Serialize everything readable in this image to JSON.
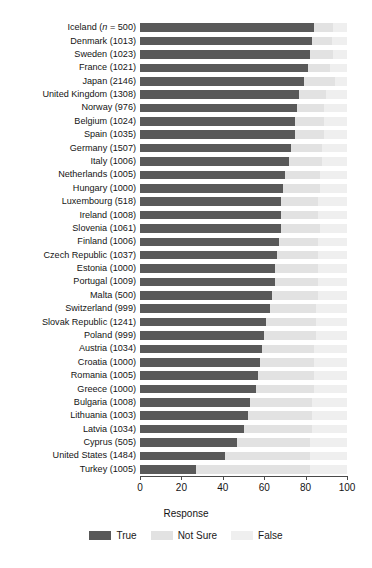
{
  "chart_data": {
    "type": "bar",
    "orientation": "horizontal",
    "stacked": true,
    "title": "",
    "xlabel": "Response",
    "ylabel": "",
    "xlim": [
      0,
      100
    ],
    "xticks": [
      0,
      20,
      40,
      60,
      80,
      100
    ],
    "grid": false,
    "legend_title": "Response",
    "legend_position": "bottom",
    "series": [
      {
        "name": "True",
        "color": "#595959"
      },
      {
        "name": "Not Sure",
        "color": "#e2e2e2"
      },
      {
        "name": "False",
        "color": "#efefef"
      }
    ],
    "categories": [
      "Iceland (n = 500)",
      "Denmark (1013)",
      "Sweden (1023)",
      "France (1021)",
      "Japan (2146)",
      "United Kingdom (1308)",
      "Norway (976)",
      "Belgium (1024)",
      "Spain (1035)",
      "Germany (1507)",
      "Italy (1006)",
      "Netherlands (1005)",
      "Hungary (1000)",
      "Luxembourg (518)",
      "Ireland (1008)",
      "Slovenia (1061)",
      "Finland (1006)",
      "Czech Republic (1037)",
      "Estonia (1000)",
      "Portugal (1009)",
      "Malta (500)",
      "Switzerland (999)",
      "Slovak Republic (1241)",
      "Poland (999)",
      "Austria (1034)",
      "Croatia (1000)",
      "Romania (1005)",
      "Greece (1000)",
      "Bulgaria (1008)",
      "Lithuania (1003)",
      "Latvia (1034)",
      "Cyprus (505)",
      "United States (1484)",
      "Turkey (1005)"
    ],
    "values": {
      "True": [
        84,
        83,
        82,
        81,
        79,
        77,
        76,
        75,
        75,
        73,
        72,
        70,
        69,
        68,
        68,
        68,
        67,
        66,
        65,
        65,
        64,
        63,
        61,
        60,
        59,
        58,
        57,
        56,
        53,
        52,
        50,
        47,
        41,
        27
      ],
      "Not Sure": [
        9,
        10,
        11,
        11,
        15,
        13,
        13,
        14,
        14,
        15,
        16,
        17,
        18,
        18,
        18,
        19,
        19,
        20,
        21,
        21,
        22,
        22,
        24,
        25,
        25,
        26,
        27,
        28,
        30,
        31,
        33,
        35,
        41,
        55
      ],
      "False": [
        7,
        7,
        7,
        8,
        6,
        10,
        11,
        11,
        11,
        12,
        12,
        13,
        13,
        14,
        14,
        13,
        14,
        14,
        14,
        14,
        14,
        15,
        15,
        15,
        16,
        16,
        16,
        16,
        17,
        17,
        17,
        18,
        18,
        18
      ]
    }
  },
  "axis": {
    "tick_labels": [
      "0",
      "20",
      "40",
      "60",
      "80",
      "100"
    ],
    "x_title": "Response"
  },
  "legend": {
    "title": "Response",
    "items": [
      {
        "label": "True",
        "color": "#595959"
      },
      {
        "label": "Not Sure",
        "color": "#e2e2e2"
      },
      {
        "label": "False",
        "color": "#efefef"
      }
    ]
  }
}
